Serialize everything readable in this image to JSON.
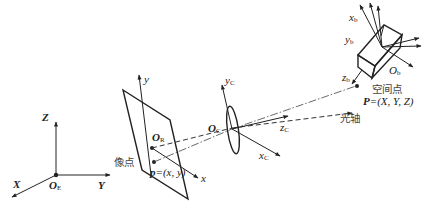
{
  "world_frame": {
    "origin": "O",
    "origin_sub": "E",
    "axes": {
      "x": "X",
      "y": "Y",
      "z": "Z"
    }
  },
  "image_plane": {
    "origin": "O",
    "origin_sub": "R",
    "axes": {
      "x": "x",
      "y": "y"
    },
    "image_point_label": "像点",
    "image_point_prefix": "p",
    "image_point_coords": "=(x, y)"
  },
  "camera_frame": {
    "origin": "O",
    "origin_sub": "C",
    "axes": {
      "x": "x",
      "x_sub": "C",
      "y": "y",
      "y_sub": "C",
      "z": "z",
      "z_sub": "C"
    }
  },
  "optical_axis_label": "光轴",
  "object_frame": {
    "origin": "O",
    "origin_sub": "b",
    "axes": {
      "x": "x",
      "x_sub": "b",
      "y": "y",
      "y_sub": "b",
      "z": "z",
      "z_sub": "b"
    }
  },
  "space_point": {
    "label": "空间点",
    "prefix": "P",
    "coords": "=(X, Y, Z)"
  }
}
